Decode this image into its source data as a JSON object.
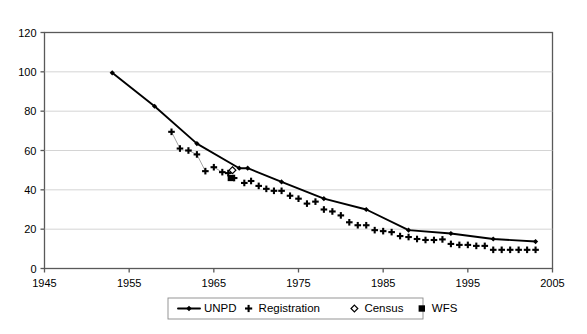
{
  "chart_data": {
    "type": "line",
    "title": "",
    "subtitle": "",
    "xlabel": "",
    "ylabel": "",
    "xlim": [
      1945,
      2005
    ],
    "ylim": [
      0,
      120
    ],
    "grid": true,
    "legend_position": "bottom",
    "xticks": [
      1945,
      1955,
      1965,
      1975,
      1985,
      1995,
      2005
    ],
    "yticks": [
      0,
      20,
      40,
      60,
      80,
      100,
      120
    ],
    "series": [
      {
        "name": "UNPD",
        "marker": "filled-diamond-line",
        "x": [
          1953,
          1958,
          1963,
          1968,
          1969,
          1973,
          1978,
          1983,
          1988,
          1993,
          1998,
          2003
        ],
        "values": [
          99.5,
          82.5,
          63.5,
          51.0,
          51.0,
          44.0,
          35.5,
          30.0,
          19.5,
          17.8,
          15.0,
          13.7
        ]
      },
      {
        "name": "Registration",
        "marker": "plus",
        "x": [
          1960,
          1961,
          1962,
          1963,
          1964,
          1965,
          1966,
          1966.7,
          1967.4,
          1968.6,
          1969.4,
          1970.3,
          1971.2,
          1972.1,
          1973,
          1974,
          1975,
          1976,
          1977,
          1978,
          1979,
          1980,
          1981,
          1982,
          1983,
          1984,
          1985,
          1986,
          1987,
          1988,
          1989,
          1990,
          1991,
          1992,
          1993,
          1994,
          1995,
          1996,
          1997,
          1998,
          1999,
          2000,
          2001,
          2002,
          2003
        ],
        "values": [
          69.5,
          61.0,
          60.0,
          58.0,
          49.5,
          51.5,
          49.0,
          48.5,
          46.0,
          43.5,
          44.5,
          42.0,
          40.5,
          39.5,
          39.5,
          37.0,
          35.5,
          33.0,
          34.0,
          30.0,
          29.0,
          27.0,
          23.5,
          22.0,
          22.0,
          19.5,
          19.0,
          18.5,
          16.5,
          16.0,
          15.0,
          14.5,
          14.5,
          14.8,
          12.5,
          12.0,
          12.0,
          11.5,
          11.5,
          9.5,
          9.5,
          9.5,
          9.5,
          9.5,
          9.5
        ]
      },
      {
        "name": "Census",
        "marker": "open-diamond",
        "x": [
          1967.2
        ],
        "values": [
          50.0
        ]
      },
      {
        "name": "WFS",
        "marker": "filled-square",
        "x": [
          1967.0
        ],
        "values": [
          46.0
        ]
      }
    ]
  },
  "axis": {
    "x_tick_labels": [
      "1945",
      "1955",
      "1965",
      "1975",
      "1985",
      "1995",
      "2005"
    ],
    "y_tick_labels": [
      "0",
      "20",
      "40",
      "60",
      "80",
      "100",
      "120"
    ]
  },
  "legend": {
    "items": [
      {
        "label": "UNPD",
        "marker": "line-with-diamond"
      },
      {
        "label": "Registration",
        "marker": "plus"
      },
      {
        "label": "Census",
        "marker": "open-diamond"
      },
      {
        "label": "WFS",
        "marker": "filled-square"
      }
    ]
  }
}
